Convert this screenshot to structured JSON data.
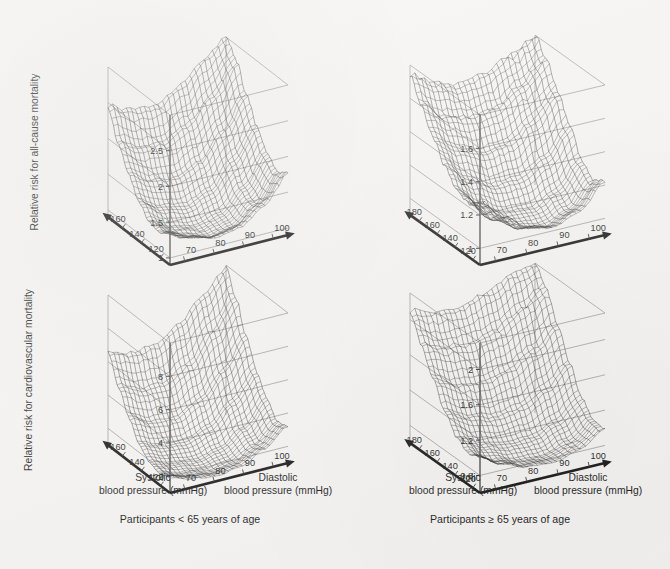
{
  "figure": {
    "background_color": "#f4f3f1",
    "ink_color": "#151515",
    "frame_color": "#8d8d8d"
  },
  "captions": {
    "left": "Participants < 65 years of age",
    "right": "Participants ≥ 65 years of age"
  },
  "axis_titles": {
    "systolic_line1": "Systolic",
    "systolic_line2": "blood pressure (mmHg)",
    "diastolic_line1": "Diastolic",
    "diastolic_line2": "blood pressure (mmHg)"
  },
  "panels": [
    {
      "id": "top-left",
      "zlabel": "Relative risk for all-cause mortality",
      "age_group": "Participants < 65 years of age",
      "outcome": "all-cause mortality"
    },
    {
      "id": "top-right",
      "zlabel": "",
      "age_group": "Participants ≥ 65 years of age",
      "outcome": "all-cause mortality"
    },
    {
      "id": "bottom-left",
      "zlabel": "Relative risk for cardiovascular mortality",
      "age_group": "Participants < 65 years of age",
      "outcome": "cardiovascular mortality"
    },
    {
      "id": "bottom-right",
      "zlabel": "",
      "age_group": "Participants ≥ 65 years of age",
      "outcome": "cardiovascular mortality"
    }
  ],
  "chart_data": [
    {
      "id": "top-left",
      "type": "surface",
      "title": "",
      "panel_caption": "Participants < 65 years of age",
      "xlabel": "Systolic blood pressure (mmHg)",
      "ylabel": "Diastolic blood pressure (mmHg)",
      "zlabel": "Relative risk for all-cause mortality",
      "x_ticks": [
        160,
        140,
        120
      ],
      "y_ticks": [
        70,
        80,
        90,
        100
      ],
      "z_ticks": [
        1.0,
        1.5,
        2.0,
        2.5
      ],
      "xlim": [
        110,
        175
      ],
      "ylim": [
        65,
        105
      ],
      "zlim": [
        0.9,
        3.0
      ],
      "grid": true,
      "legend": "none",
      "description": "Mesh surface of relative risk for all-cause mortality rising steeply at high systolic and high diastolic blood pressure, with a shallow minimum near 120/70-80 mmHg.",
      "surface": {
        "x": [
          115,
          125,
          135,
          145,
          155,
          165,
          175
        ],
        "y": [
          65,
          72,
          79,
          86,
          93,
          100
        ],
        "z": [
          [
            1.35,
            1.2,
            1.12,
            1.18,
            1.4,
            1.75
          ],
          [
            1.25,
            1.1,
            1.02,
            1.08,
            1.32,
            1.68
          ],
          [
            1.28,
            1.12,
            1.05,
            1.14,
            1.42,
            1.82
          ],
          [
            1.45,
            1.28,
            1.22,
            1.35,
            1.68,
            2.08
          ],
          [
            1.72,
            1.55,
            1.5,
            1.65,
            2.0,
            2.42
          ],
          [
            2.05,
            1.9,
            1.88,
            2.05,
            2.38,
            2.78
          ],
          [
            2.45,
            2.32,
            2.3,
            2.48,
            2.78,
            3.0
          ]
        ]
      }
    },
    {
      "id": "top-right",
      "type": "surface",
      "title": "",
      "panel_caption": "Participants ≥ 65 years of age",
      "xlabel": "Systolic blood pressure (mmHg)",
      "ylabel": "Diastolic blood pressure (mmHg)",
      "zlabel": "Relative risk for all-cause mortality",
      "x_ticks": [
        180,
        160,
        140,
        120
      ],
      "y_ticks": [
        70,
        80,
        90,
        100
      ],
      "z_ticks": [
        1.0,
        1.2,
        1.4,
        1.6
      ],
      "xlim": [
        112,
        190
      ],
      "ylim": [
        65,
        105
      ],
      "zlim": [
        0.9,
        1.8
      ],
      "grid": true,
      "legend": "none",
      "description": "Mesh surface of relative risk for all-cause mortality in older participants; flatter gradient, rising toward high systolic pressure and at the extremes of diastolic pressure.",
      "surface": {
        "x": [
          115,
          127,
          139,
          151,
          163,
          175,
          187
        ],
        "y": [
          65,
          72,
          79,
          86,
          93,
          100
        ],
        "z": [
          [
            1.28,
            1.15,
            1.05,
            1.02,
            1.08,
            1.22
          ],
          [
            1.22,
            1.08,
            1.0,
            0.98,
            1.04,
            1.18
          ],
          [
            1.25,
            1.12,
            1.04,
            1.03,
            1.1,
            1.25
          ],
          [
            1.34,
            1.22,
            1.15,
            1.16,
            1.24,
            1.4
          ],
          [
            1.46,
            1.36,
            1.3,
            1.32,
            1.42,
            1.56
          ],
          [
            1.6,
            1.5,
            1.46,
            1.48,
            1.58,
            1.7
          ],
          [
            1.74,
            1.66,
            1.62,
            1.65,
            1.72,
            1.8
          ]
        ]
      }
    },
    {
      "id": "bottom-left",
      "type": "surface",
      "title": "",
      "panel_caption": "Participants < 65 years of age",
      "xlabel": "Systolic blood pressure (mmHg)",
      "ylabel": "Diastolic blood pressure (mmHg)",
      "zlabel": "Relative risk for cardiovascular mortality",
      "x_ticks": [
        160,
        140,
        120
      ],
      "y_ticks": [
        70,
        80,
        90,
        100
      ],
      "z_ticks": [
        2,
        4,
        6,
        8
      ],
      "xlim": [
        110,
        175
      ],
      "ylim": [
        65,
        105
      ],
      "zlim": [
        1.0,
        10.0
      ],
      "grid": true,
      "legend": "none",
      "description": "Mesh surface of relative risk for cardiovascular mortality in younger participants, rising very steeply to about 9 at high systolic and diastolic blood pressure.",
      "surface": {
        "x": [
          115,
          125,
          135,
          145,
          155,
          165,
          175
        ],
        "y": [
          65,
          72,
          79,
          86,
          93,
          100
        ],
        "z": [
          [
            1.9,
            1.5,
            1.3,
            1.5,
            2.2,
            3.2
          ],
          [
            1.7,
            1.3,
            1.1,
            1.3,
            2.0,
            3.0
          ],
          [
            1.9,
            1.5,
            1.3,
            1.6,
            2.5,
            3.8
          ],
          [
            2.5,
            2.0,
            1.9,
            2.4,
            3.6,
            5.0
          ],
          [
            3.6,
            3.0,
            2.9,
            3.6,
            5.0,
            6.6
          ],
          [
            5.0,
            4.4,
            4.4,
            5.2,
            6.8,
            8.4
          ],
          [
            6.6,
            6.2,
            6.3,
            7.2,
            8.6,
            9.8
          ]
        ]
      }
    },
    {
      "id": "bottom-right",
      "type": "surface",
      "title": "",
      "panel_caption": "Participants ≥ 65 years of age",
      "xlabel": "Systolic blood pressure (mmHg)",
      "ylabel": "Diastolic blood pressure (mmHg)",
      "zlabel": "Relative risk for cardiovascular mortality",
      "x_ticks": [
        180,
        160,
        140,
        120
      ],
      "y_ticks": [
        70,
        80,
        90,
        100
      ],
      "z_ticks": [
        0.8,
        1.2,
        1.6,
        2.0
      ],
      "xlim": [
        112,
        190
      ],
      "ylim": [
        65,
        105
      ],
      "zlim": [
        0.6,
        2.3
      ],
      "grid": true,
      "legend": "none",
      "description": "Mesh surface of relative risk for cardiovascular mortality in older participants, increasing steadily with systolic blood pressure with a shallow diastolic minimum near 80 mmHg.",
      "surface": {
        "x": [
          115,
          127,
          139,
          151,
          163,
          175,
          187
        ],
        "y": [
          65,
          72,
          79,
          86,
          93,
          100
        ],
        "z": [
          [
            1.0,
            0.85,
            0.76,
            0.74,
            0.82,
            0.98
          ],
          [
            0.96,
            0.82,
            0.74,
            0.73,
            0.82,
            1.0
          ],
          [
            1.04,
            0.9,
            0.83,
            0.84,
            0.95,
            1.15
          ],
          [
            1.24,
            1.1,
            1.04,
            1.08,
            1.22,
            1.44
          ],
          [
            1.5,
            1.38,
            1.34,
            1.4,
            1.56,
            1.76
          ],
          [
            1.8,
            1.7,
            1.68,
            1.76,
            1.92,
            2.08
          ],
          [
            2.1,
            2.02,
            2.02,
            2.1,
            2.22,
            2.3
          ]
        ]
      }
    }
  ]
}
